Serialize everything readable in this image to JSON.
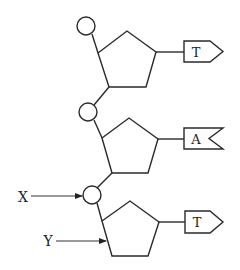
{
  "diagram": {
    "title": "",
    "nucleotides": [
      {
        "phosphate": {
          "cx": 86,
          "cy": 26,
          "r": 9
        },
        "sugar": [
          [
            98,
            53
          ],
          [
            127,
            31
          ],
          [
            156,
            52
          ],
          [
            146,
            87
          ],
          [
            109,
            87
          ]
        ],
        "base_link": [
          [
            156,
            52
          ],
          [
            184,
            52
          ]
        ],
        "base": {
          "label": "T",
          "shape": "pointed",
          "x": 184,
          "y": 41,
          "w": 26,
          "h": 21,
          "tip": 13
        }
      },
      {
        "phosphate": {
          "cx": 88,
          "cy": 112,
          "r": 9
        },
        "sugar": [
          [
            102,
            138
          ],
          [
            129,
            118
          ],
          [
            158,
            139
          ],
          [
            148,
            173
          ],
          [
            112,
            173
          ]
        ],
        "base_link": [
          [
            158,
            139
          ],
          [
            184,
            139
          ]
        ],
        "base": {
          "label": "A",
          "shape": "notched",
          "x": 184,
          "y": 128,
          "w": 39,
          "h": 21,
          "notch": 14
        }
      },
      {
        "phosphate": {
          "cx": 92,
          "cy": 195,
          "r": 9
        },
        "sugar": [
          [
            102,
            221
          ],
          [
            130,
            201
          ],
          [
            159,
            222
          ],
          [
            148,
            256
          ],
          [
            112,
            256
          ]
        ],
        "base_link": [
          [
            159,
            222
          ],
          [
            185,
            222
          ]
        ],
        "base": {
          "label": "T",
          "shape": "pointed",
          "x": 185,
          "y": 211,
          "w": 25,
          "h": 22,
          "tip": 13
        }
      }
    ],
    "backbone_links": [
      [
        [
          92,
          34
        ],
        [
          98,
          53
        ]
      ],
      [
        [
          109,
          87
        ],
        [
          94,
          105
        ]
      ],
      [
        [
          94,
          120
        ],
        [
          102,
          138
        ]
      ],
      [
        [
          112,
          173
        ],
        [
          97,
          188
        ]
      ],
      [
        [
          97,
          203
        ],
        [
          102,
          221
        ]
      ]
    ],
    "pointers": [
      {
        "label": "X",
        "label_x": 23,
        "label_y": 202,
        "from": [
          31,
          196
        ],
        "to": [
          82,
          196
        ]
      },
      {
        "label": "Y",
        "label_x": 48,
        "label_y": 246,
        "from": [
          56,
          241
        ],
        "to": [
          106,
          241
        ]
      }
    ],
    "colors": {
      "stroke": "#2a2a2a",
      "background": "#ffffff",
      "text": "#222222"
    }
  }
}
